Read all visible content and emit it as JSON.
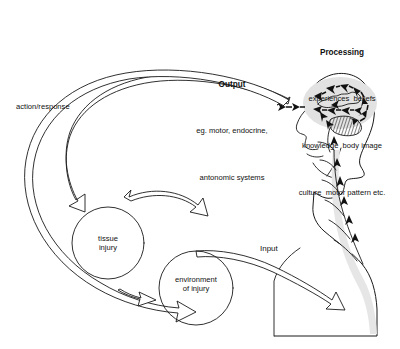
{
  "diagram": {
    "background_color": "#ffffff",
    "line_color": "#1a1a1a",
    "labels": {
      "processing": {
        "heading": "Processing",
        "line1": "experiences  beliefs",
        "line2": "knowledge  body image",
        "line3": "culture  motor pattern etc."
      },
      "output": {
        "heading": "Output",
        "line1": "eg. motor, endocrine,",
        "line2": "antonomic systems"
      },
      "action_response": "action/response",
      "input": "Input",
      "tissue_injury": {
        "line1": "tissue",
        "line2": "injury"
      },
      "environment_of_injury": {
        "line1": "environment",
        "line2": "of injury"
      }
    },
    "nodes": [
      {
        "id": "tissue-injury-circle",
        "shape": "circle",
        "cx": 108,
        "cy": 243,
        "r": 36
      },
      {
        "id": "environment-of-injury-circle",
        "shape": "circle",
        "cx": 196,
        "cy": 288,
        "r": 37
      }
    ],
    "figure": {
      "name": "human-head-and-torso-profile",
      "facing": "left",
      "parts": [
        "head-profile",
        "brain",
        "cerebellum",
        "neck",
        "spinal-cord",
        "torso"
      ]
    },
    "flows": [
      {
        "id": "output-flow",
        "from": "head",
        "to": "tissue-injury-circle",
        "style": "hollow-arrow",
        "label": "Output"
      },
      {
        "id": "action-response-flow",
        "from": "head",
        "to": "environment-of-injury-circle",
        "style": "hollow-arrow",
        "label": "action/response"
      },
      {
        "id": "inter-circle-flow",
        "from": "tissue-injury-circle",
        "to": "environment-of-injury-circle",
        "style": "hollow-arrow"
      },
      {
        "id": "input-flow",
        "from": "circles",
        "to": "spinal-cord",
        "style": "hollow-arrow",
        "label": "Input"
      },
      {
        "id": "brain-circulation",
        "style": "dashed-solid-arrows",
        "description": "arrows circulating around brain"
      },
      {
        "id": "spinal-ascending",
        "style": "solid-arrows",
        "description": "upward arrows along spinal cord"
      }
    ]
  }
}
